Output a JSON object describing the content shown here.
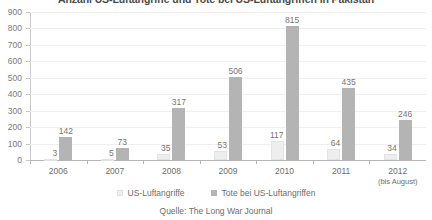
{
  "chart_data": {
    "type": "bar",
    "title": "Anzahl US-Luftangriffe und Tote bei US-Luftangriffen in Pakistan",
    "xlabel": "",
    "ylabel": "",
    "ylim": [
      0,
      900
    ],
    "ytick_step": 100,
    "grid": true,
    "legend_position": "bottom",
    "source": "Quelle: The Long War Journal",
    "categories": [
      "2006",
      "2007",
      "2008",
      "2009",
      "2010",
      "2011",
      "2012"
    ],
    "category_sublabels": [
      "",
      "",
      "",
      "",
      "",
      "",
      "(bis August)"
    ],
    "ytick_labels": [
      "900",
      "800",
      "700",
      "600",
      "500",
      "400",
      "300",
      "200",
      "100",
      "0"
    ],
    "ytick_values": [
      900,
      800,
      700,
      600,
      500,
      400,
      300,
      200,
      100,
      0
    ],
    "series": [
      {
        "name": "US-Luftangriffe",
        "color": "#eeeeee",
        "values": [
          3,
          5,
          35,
          53,
          117,
          64,
          34
        ]
      },
      {
        "name": "Tote bei US-Luftangriffen",
        "color": "#b4b4b4",
        "values": [
          142,
          73,
          317,
          506,
          815,
          435,
          246
        ]
      }
    ]
  },
  "colors": {
    "strikes": "#eeeeee",
    "deaths": "#b4b4b4",
    "gridline": "#efefef",
    "axis": "#b5b5b5",
    "text": "#6e6e6e"
  }
}
